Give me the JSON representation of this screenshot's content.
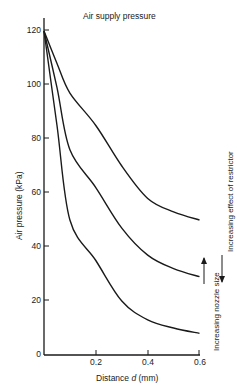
{
  "chart_data": {
    "type": "line",
    "title": "Air supply pressure",
    "xlabel": "Distance d (mm)",
    "xlabel_prefix": "Distance ",
    "xlabel_var": "d",
    "xlabel_unit": " (mm)",
    "ylabel": "Air pressure (kPa)",
    "xlim": [
      0,
      0.6
    ],
    "ylim": [
      0,
      125
    ],
    "x_ticks": [
      "0.2",
      "0.4",
      "0.6"
    ],
    "y_ticks": [
      "0",
      "20",
      "40",
      "60",
      "80",
      "100",
      "120"
    ],
    "grid": false,
    "x": [
      0,
      0.05,
      0.1,
      0.2,
      0.3,
      0.4,
      0.5,
      0.6
    ],
    "series": [
      {
        "name": "Smallest nozzle",
        "values": [
          120,
          108,
          97,
          85,
          70,
          58,
          53,
          50
        ]
      },
      {
        "name": "Medium nozzle",
        "values": [
          120,
          99,
          76,
          62,
          47,
          37,
          32,
          29
        ]
      },
      {
        "name": "Largest nozzle",
        "values": [
          120,
          85,
          50,
          35,
          20,
          13,
          10,
          8
        ]
      }
    ],
    "annotations": [
      "Increasing effect of restrictor",
      "Increasing nozzle size"
    ]
  }
}
